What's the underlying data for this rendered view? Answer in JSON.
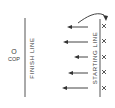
{
  "diagram": {
    "cop": {
      "symbol": "O",
      "label": "COP"
    },
    "finish_line": {
      "label": "FINISH LINE"
    },
    "starting_line": {
      "label": "STARTING LINE"
    },
    "runners": {
      "count": 5,
      "marker": "X"
    },
    "arrows": {
      "direction": "left",
      "count": 5,
      "return_arrow": "curved arrow from first lane back to starting line"
    },
    "colors": {
      "ink": "#444444",
      "background": "#ffffff"
    }
  }
}
